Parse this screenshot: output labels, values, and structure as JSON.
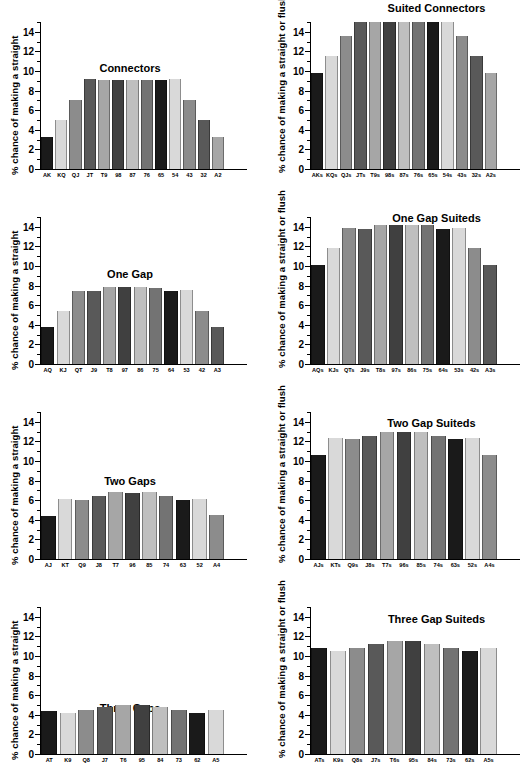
{
  "figure": {
    "bar_palette": [
      "#1a1a1a",
      "#d9d9d9",
      "#8c8c8c",
      "#595959",
      "#a6a6a6",
      "#404040",
      "#bfbfbf",
      "#737373"
    ],
    "axis_color": "#000000",
    "background": "#ffffff"
  },
  "chart_data": [
    {
      "type": "bar",
      "title": "Connectors",
      "ylabel": "% chance of making a straight",
      "xlabel": "",
      "ylim": [
        0,
        15
      ],
      "yticks": [
        0,
        2,
        4,
        6,
        8,
        10,
        12,
        14
      ],
      "grid": false,
      "legend": "none",
      "categories": [
        "AK",
        "KQ",
        "QJ",
        "JT",
        "T9",
        "98",
        "87",
        "76",
        "65",
        "54",
        "43",
        "32",
        "A2"
      ],
      "values": [
        3.3,
        5.0,
        7.0,
        9.2,
        9.1,
        9.1,
        9.1,
        9.1,
        9.1,
        9.2,
        7.0,
        5.0,
        3.3
      ]
    },
    {
      "type": "bar",
      "title": "Suited Connectors",
      "ylabel": "% chance of making a straight or flush",
      "xlabel": "",
      "ylim": [
        0,
        15
      ],
      "yticks": [
        0,
        2,
        4,
        6,
        8,
        10,
        12,
        14
      ],
      "grid": false,
      "legend": "none",
      "categories": [
        "AKs",
        "KQs",
        "QJs",
        "JTs",
        "T9s",
        "98s",
        "87s",
        "76s",
        "65s",
        "54s",
        "43s",
        "32s",
        "A2s"
      ],
      "values": [
        9.8,
        11.5,
        13.6,
        15.5,
        15.4,
        15.4,
        15.4,
        15.4,
        15.4,
        15.5,
        13.6,
        11.5,
        9.8
      ]
    },
    {
      "type": "bar",
      "title": "One Gap",
      "ylabel": "% chance of making a straight",
      "xlabel": "",
      "ylim": [
        0,
        15
      ],
      "yticks": [
        0,
        2,
        4,
        6,
        8,
        10,
        12,
        14
      ],
      "grid": false,
      "legend": "none",
      "categories": [
        "AQ",
        "KJ",
        "QT",
        "J9",
        "T8",
        "97",
        "86",
        "75",
        "64",
        "53",
        "42",
        "A3"
      ],
      "values": [
        3.8,
        5.4,
        7.5,
        7.45,
        7.85,
        7.85,
        7.85,
        7.8,
        7.45,
        7.55,
        5.4,
        3.75
      ]
    },
    {
      "type": "bar",
      "title": "One Gap Suiteds",
      "ylabel": "% chance of making a straight or flush",
      "xlabel": "",
      "ylim": [
        0,
        15
      ],
      "yticks": [
        0,
        2,
        4,
        6,
        8,
        10,
        12,
        14
      ],
      "grid": false,
      "legend": "none",
      "categories": [
        "AQs",
        "KJs",
        "QTs",
        "J9s",
        "T8s",
        "97s",
        "86s",
        "75s",
        "64s",
        "53s",
        "42s",
        "A3s"
      ],
      "values": [
        10.1,
        11.8,
        13.9,
        13.75,
        14.2,
        14.2,
        14.15,
        14.2,
        13.8,
        13.9,
        11.8,
        10.1
      ]
    },
    {
      "type": "bar",
      "title": "Two Gaps",
      "ylabel": "% chance of making a straight",
      "xlabel": "",
      "ylim": [
        0,
        15
      ],
      "yticks": [
        0,
        2,
        4,
        6,
        8,
        10,
        12,
        14
      ],
      "grid": false,
      "legend": "none",
      "categories": [
        "AJ",
        "KT",
        "Q9",
        "J8",
        "T7",
        "96",
        "85",
        "74",
        "63",
        "52",
        "A4"
      ],
      "values": [
        4.4,
        6.1,
        6.0,
        6.4,
        6.8,
        6.7,
        6.8,
        6.4,
        6.0,
        6.1,
        4.5
      ]
    },
    {
      "type": "bar",
      "title": "Two Gap Suiteds",
      "ylabel": "% chance of making a straight or flush",
      "xlabel": "",
      "ylim": [
        0,
        15
      ],
      "yticks": [
        0,
        2,
        4,
        6,
        8,
        10,
        12,
        14
      ],
      "grid": false,
      "legend": "none",
      "categories": [
        "AJs",
        "KTs",
        "Q9s",
        "J8s",
        "T7s",
        "96s",
        "85s",
        "74s",
        "63s",
        "52s",
        "A4s"
      ],
      "values": [
        10.6,
        12.3,
        12.2,
        12.6,
        12.95,
        12.95,
        13.0,
        12.6,
        12.2,
        12.3,
        10.65
      ]
    },
    {
      "type": "bar",
      "title": "Three Gaps",
      "ylabel": "% chance of making a straight",
      "xlabel": "",
      "ylim": [
        0,
        15
      ],
      "yticks": [
        0,
        2,
        4,
        6,
        8,
        10,
        12,
        14
      ],
      "grid": false,
      "legend": "none",
      "categories": [
        "AT",
        "K9",
        "Q8",
        "J7",
        "T6",
        "95",
        "84",
        "73",
        "62",
        "A5"
      ],
      "values": [
        4.4,
        4.15,
        4.45,
        4.8,
        5.0,
        5.0,
        4.8,
        4.45,
        4.15,
        4.45
      ]
    },
    {
      "type": "bar",
      "title": "Three Gap Suiteds",
      "ylabel": "% chance of making a straight or flush",
      "xlabel": "",
      "ylim": [
        0,
        15
      ],
      "yticks": [
        0,
        2,
        4,
        6,
        8,
        10,
        12,
        14
      ],
      "grid": false,
      "legend": "none",
      "categories": [
        "ATs",
        "K9s",
        "Q8s",
        "J7s",
        "T6s",
        "95s",
        "84s",
        "73s",
        "62s",
        "A5s"
      ],
      "values": [
        10.8,
        10.5,
        10.8,
        11.2,
        11.5,
        11.5,
        11.2,
        10.8,
        10.5,
        10.8
      ]
    }
  ]
}
